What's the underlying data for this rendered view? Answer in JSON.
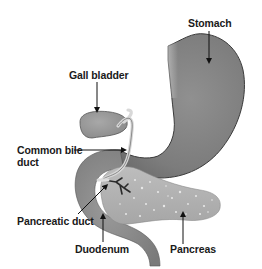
{
  "diagram": {
    "colors": {
      "background": "#ffffff",
      "stomach": "#8a8a8a",
      "stomach_outline": "#3a3a3a",
      "gall_bladder": "#9a9a9a",
      "duodenum": "#8f8f8f",
      "pancreas": "#b4b4b4",
      "pancreas_speckle": "#e6e6e6",
      "duct": "#d8d8d8",
      "arrow": "#111111",
      "text": "#1a1a1a"
    },
    "labels": {
      "stomach": "Stomach",
      "gall_bladder": "Gall bladder",
      "common_bile_duct_line1": "Common bile",
      "common_bile_duct_line2": "duct",
      "pancreatic_duct": "Pancreatic duct",
      "duodenum": "Duodenum",
      "pancreas": "Pancreas"
    }
  }
}
